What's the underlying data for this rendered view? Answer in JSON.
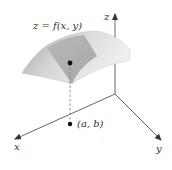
{
  "diagram": {
    "title_label": "z = f(x, y)",
    "point_label": "(a, b)",
    "axes": {
      "x_label": "x",
      "y_label": "y",
      "z_label": "z"
    },
    "colors": {
      "axis": "#555555",
      "surface_light": "#e6e6e6",
      "surface_mid": "#c8c8c8",
      "surface_patch": "#a9a9a9",
      "point": "#111111",
      "dashed": "#777777"
    }
  }
}
